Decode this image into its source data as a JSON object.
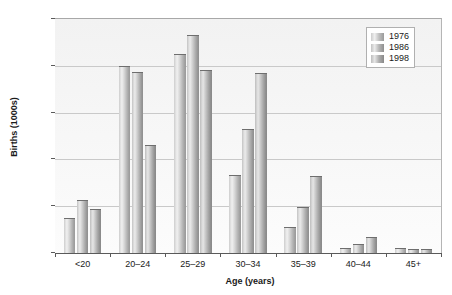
{
  "chart_data": {
    "type": "bar",
    "title": "",
    "xlabel": "Age (years)",
    "ylabel": "Births (1000s)",
    "categories": [
      "<20",
      "20–24",
      "25–29",
      "30–34",
      "35–39",
      "40–44",
      "45+"
    ],
    "series": [
      {
        "name": "1976",
        "values": [
          37,
          200,
          213,
          83,
          28,
          5,
          5
        ]
      },
      {
        "name": "1986",
        "values": [
          57,
          193,
          233,
          132,
          49,
          10,
          4
        ]
      },
      {
        "name": "1998",
        "values": [
          47,
          115,
          196,
          192,
          82,
          17,
          4
        ]
      }
    ],
    "ylim": [
      0,
      250
    ],
    "yticks": [
      0,
      50,
      100,
      150,
      200,
      250
    ],
    "ytick_labels": [
      "0",
      "50",
      "100",
      "150",
      "200",
      "250"
    ],
    "grid": true,
    "grid_axis": "y",
    "legend_position": "top-right",
    "bar_style": "cylinder-gradient-grayscale",
    "colors": {
      "series_1976": "#cfcfcf",
      "series_1986": "#c3c3c3",
      "series_1998": "#bdbdbd",
      "plot_background": "#f4f4f4",
      "gridline": "#c9c9c9",
      "axis": "#5a5a5a",
      "text": "#1a1a1a"
    }
  }
}
